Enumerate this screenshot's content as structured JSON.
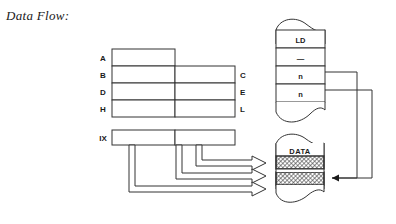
{
  "figure": {
    "caption": "Data Flow:",
    "colors": {
      "ink": "#1a1a1a",
      "stroke": "#333333",
      "background": "#ffffff",
      "hatch": "#555555"
    }
  },
  "registers": {
    "name": "cpu-register-file",
    "left_labels": [
      "A",
      "B",
      "D",
      "H"
    ],
    "right_labels": [
      "C",
      "E",
      "L"
    ],
    "rows": [
      {
        "left": "A",
        "right": "",
        "split": false
      },
      {
        "left": "B",
        "right": "C",
        "split": true
      },
      {
        "left": "D",
        "right": "E",
        "split": true
      },
      {
        "left": "H",
        "right": "L",
        "split": true
      }
    ],
    "index_register": {
      "label": "IX",
      "split": true
    }
  },
  "memory": {
    "name": "program-memory-block",
    "cells": [
      "LD",
      "—",
      "n",
      "n"
    ],
    "torn_top": true,
    "torn_bottom": true
  },
  "data_block": {
    "name": "data-memory-block",
    "label": "DATA",
    "hatched_rows": 2,
    "torn_top": true,
    "torn_bottom": true
  },
  "arrows": {
    "address_arrows": 3,
    "operand_feed_wires": 2,
    "data_in_arrow": 1
  }
}
